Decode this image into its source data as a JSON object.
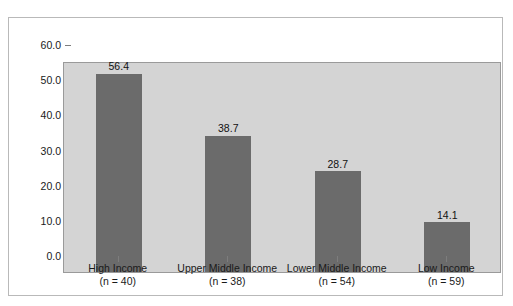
{
  "chart_data": {
    "type": "bar",
    "title": "",
    "title_visible_fragment": "",
    "xlabel": "",
    "ylabel": "",
    "categories": [
      "High Income",
      "Upper Middle Income",
      "Lower Middle Income",
      "Low Income"
    ],
    "category_sample_sizes": [
      "(n = 40)",
      "(n = 38)",
      "(n = 54)",
      "(n = 59)"
    ],
    "values": [
      56.4,
      38.7,
      28.7,
      14.1
    ],
    "value_labels": [
      "56.4",
      "38.7",
      "28.7",
      "14.1"
    ],
    "ylim": [
      0.0,
      60.0
    ],
    "ytick_labels": [
      "60.0",
      "50.0",
      "40.0",
      "30.0",
      "20.0",
      "10.0",
      "0.0"
    ],
    "ytick_values": [
      60.0,
      50.0,
      40.0,
      30.0,
      20.0,
      10.0,
      0.0
    ],
    "grid": false,
    "legend": "none",
    "colors": {
      "bar": "#6b6b6b",
      "plot_background": "#d4d4d4",
      "page_background": "#ffffff",
      "frame_border": "#b9b9b9",
      "plot_border": "#9a9a9a",
      "axis_text": "#1a1a1a"
    }
  }
}
